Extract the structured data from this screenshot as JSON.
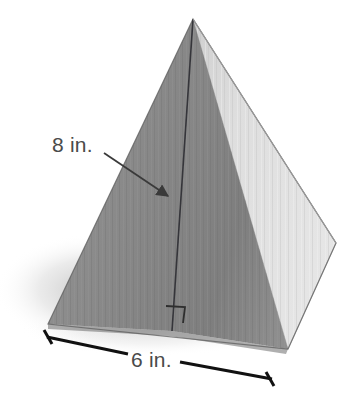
{
  "figure": {
    "name": "wooden-square-pyramid-diagram",
    "background_color": "#ffffff",
    "labels": {
      "slant_height": "8 in.",
      "base_edge": "6 in."
    },
    "annotations": {
      "slant_height_leader": "arrow pointing from the 8 in. label to the front slant edge of the pyramid",
      "base_dimension_line": "dimension line with end ticks spanning the front-left base edge",
      "right_angle_marker": "small square indicating a right angle where the slant height meets the base"
    },
    "colors": {
      "left_face": "#8e8e8e",
      "front_right_face": "#848484",
      "right_face": "#dedede",
      "edge_line": "#3b3b3b",
      "label_text": "#4a4a4a",
      "dimension_line": "#111111",
      "shadow": "#d8d8d8",
      "background": "#ffffff"
    },
    "geometry": {
      "apex": [
        193,
        19
      ],
      "left_base_corner": [
        48,
        324
      ],
      "front_base_corner": [
        288,
        349
      ],
      "right_base_corner": [
        336,
        243
      ],
      "front_edge_base_point": [
        172,
        331
      ]
    }
  }
}
